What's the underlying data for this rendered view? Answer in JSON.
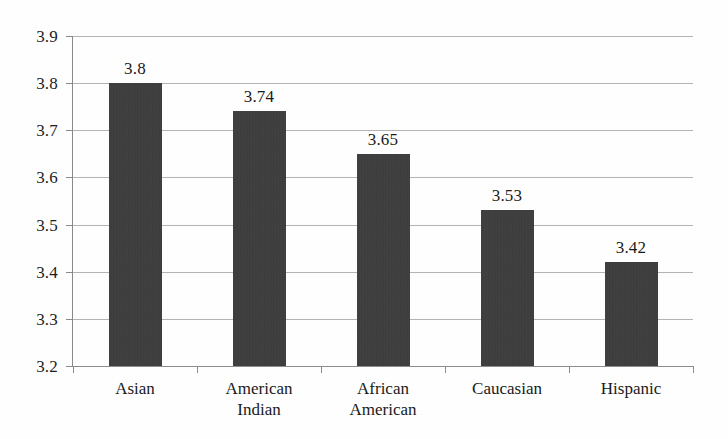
{
  "chart_data": {
    "type": "bar",
    "title": "",
    "subtitle": "",
    "xlabel": "",
    "ylabel": "",
    "categories": [
      "Asian",
      "American Indian",
      "African American",
      "Caucasian",
      "Hispanic"
    ],
    "category_lines": [
      [
        "Asian"
      ],
      [
        "American",
        "Indian"
      ],
      [
        "African",
        "American"
      ],
      [
        "Caucasian"
      ],
      [
        "Hispanic"
      ]
    ],
    "values": [
      3.8,
      3.74,
      3.65,
      3.53,
      3.42
    ],
    "value_labels": [
      "3.8",
      "3.74",
      "3.65",
      "3.53",
      "3.42"
    ],
    "ylim": [
      3.2,
      3.9
    ],
    "ytick_step": 0.1,
    "ytick_labels": [
      "3.9",
      "3.8",
      "3.7",
      "3.6",
      "3.5",
      "3.4",
      "3.3",
      "3.2"
    ],
    "ytick_values": [
      3.9,
      3.8,
      3.7,
      3.6,
      3.5,
      3.4,
      3.3,
      3.2
    ],
    "grid": true,
    "legend": false,
    "legend_position": "none",
    "bar_color": "#3b3b3b",
    "gridline_color": "#b3b3b3",
    "axis_color": "#8a8a8a",
    "text_color": "#1a1a1a",
    "background_color": "#fefefe"
  }
}
